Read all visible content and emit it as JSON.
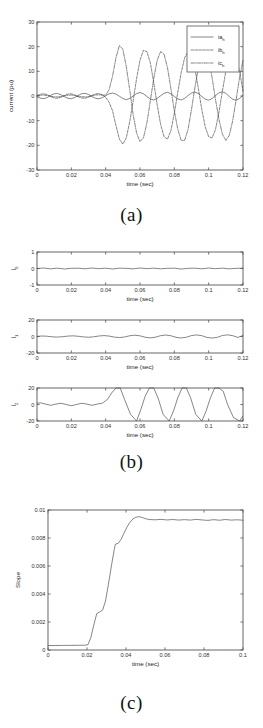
{
  "figure": {
    "panels": [
      {
        "id": "a",
        "caption": "(a)",
        "chart_index": 0
      },
      {
        "id": "b",
        "caption": "(b)",
        "chart_index": 1
      },
      {
        "id": "c",
        "caption": "(c)",
        "chart_index": 2
      }
    ]
  },
  "chart_data": [
    {
      "type": "line",
      "panel": "a",
      "title": "",
      "xlabel": "time (sec)",
      "ylabel": "current (pu)",
      "xlim": [
        0,
        0.12
      ],
      "ylim": [
        -30,
        30
      ],
      "xticks": [
        0,
        0.02,
        0.04,
        0.06,
        0.08,
        0.1,
        0.12
      ],
      "xticklabels": [
        "0",
        "0.02",
        "0.04",
        "0.06",
        "0.08",
        "0.1",
        "0.12"
      ],
      "yticks": [
        -30,
        -20,
        -10,
        0,
        10,
        20,
        30
      ],
      "yticklabels": [
        "-30",
        "-20",
        "-10",
        "0",
        "10",
        "20",
        "30"
      ],
      "grid": false,
      "legend": {
        "position": "upper-right",
        "entries": [
          {
            "label": "ia_h",
            "base": "ia",
            "sub": "h",
            "style": "solid"
          },
          {
            "label": "ib_h",
            "base": "ib",
            "sub": "h",
            "style": "dash"
          },
          {
            "label": "ic_h",
            "base": "ic",
            "sub": "h",
            "style": "dashdot"
          }
        ]
      },
      "series": [
        {
          "name": "ia_h",
          "style": "solid",
          "x": [
            0,
            0.002,
            0.004,
            0.006,
            0.008,
            0.01,
            0.012,
            0.014,
            0.016,
            0.018,
            0.02,
            0.022,
            0.024,
            0.026,
            0.028,
            0.03,
            0.032,
            0.034,
            0.036,
            0.038,
            0.04,
            0.042,
            0.044,
            0.046,
            0.048,
            0.05,
            0.052,
            0.054,
            0.056,
            0.058,
            0.06,
            0.062,
            0.064,
            0.066,
            0.068,
            0.07,
            0.072,
            0.074,
            0.076,
            0.078,
            0.08,
            0.082,
            0.084,
            0.086,
            0.088,
            0.09,
            0.092,
            0.094,
            0.096,
            0.098,
            0.1,
            0.102,
            0.104,
            0.106,
            0.108,
            0.11,
            0.112,
            0.114,
            0.116,
            0.118,
            0.12
          ],
          "y": [
            -0.3,
            -0.9,
            -1.1,
            -0.6,
            0.3,
            0.9,
            1.0,
            0.5,
            -0.3,
            -0.9,
            -1.1,
            -0.6,
            0.2,
            0.9,
            1.1,
            0.6,
            -0.2,
            -0.9,
            -1.1,
            -0.7,
            0.1,
            0.9,
            1.2,
            0.8,
            -0.1,
            -1.0,
            -1.5,
            -1.0,
            0.0,
            1.0,
            1.4,
            0.9,
            -0.2,
            -1.2,
            -1.6,
            -1.0,
            0.1,
            1.1,
            1.5,
            0.9,
            -0.2,
            -1.2,
            -1.6,
            -1.0,
            0.2,
            1.2,
            1.6,
            1.0,
            -0.2,
            -1.3,
            -1.7,
            -1.0,
            0.2,
            1.3,
            1.7,
            1.1,
            -0.2,
            -1.3,
            -1.7,
            -1.0,
            0.3
          ]
        },
        {
          "name": "ib_h",
          "style": "dash",
          "x": [
            0,
            0.002,
            0.004,
            0.006,
            0.008,
            0.01,
            0.012,
            0.014,
            0.016,
            0.018,
            0.02,
            0.022,
            0.024,
            0.026,
            0.028,
            0.03,
            0.032,
            0.034,
            0.036,
            0.038,
            0.04,
            0.042,
            0.044,
            0.046,
            0.048,
            0.05,
            0.052,
            0.054,
            0.056,
            0.058,
            0.06,
            0.062,
            0.064,
            0.066,
            0.068,
            0.07,
            0.072,
            0.074,
            0.076,
            0.078,
            0.08,
            0.082,
            0.084,
            0.086,
            0.088,
            0.09,
            0.092,
            0.094,
            0.096,
            0.098,
            0.1,
            0.102,
            0.104,
            0.106,
            0.108,
            0.11,
            0.112,
            0.114,
            0.116,
            0.118,
            0.12
          ],
          "y": [
            0.2,
            0.7,
            0.9,
            0.5,
            -0.3,
            -0.8,
            -0.9,
            -0.5,
            0.2,
            0.8,
            0.9,
            0.4,
            -0.3,
            -0.8,
            -0.9,
            -0.5,
            0.2,
            0.8,
            1.0,
            0.5,
            -0.5,
            -2.5,
            -6.0,
            -12.0,
            -17.5,
            -19.5,
            -17.0,
            -10.5,
            -2.0,
            7.0,
            14.5,
            18.5,
            18.0,
            13.5,
            5.5,
            -3.5,
            -11.5,
            -16.5,
            -17.5,
            -14.0,
            -7.0,
            1.5,
            9.5,
            15.5,
            18.0,
            16.5,
            11.0,
            3.0,
            -5.5,
            -12.5,
            -16.5,
            -17.0,
            -13.5,
            -6.5,
            2.0,
            10.0,
            15.5,
            17.5,
            15.5,
            10.0,
            2.0
          ]
        },
        {
          "name": "ic_h",
          "style": "dashdot",
          "x": [
            0,
            0.002,
            0.004,
            0.006,
            0.008,
            0.01,
            0.012,
            0.014,
            0.016,
            0.018,
            0.02,
            0.022,
            0.024,
            0.026,
            0.028,
            0.03,
            0.032,
            0.034,
            0.036,
            0.038,
            0.04,
            0.042,
            0.044,
            0.046,
            0.048,
            0.05,
            0.052,
            0.054,
            0.056,
            0.058,
            0.06,
            0.062,
            0.064,
            0.066,
            0.068,
            0.07,
            0.072,
            0.074,
            0.076,
            0.078,
            0.08,
            0.082,
            0.084,
            0.086,
            0.088,
            0.09,
            0.092,
            0.094,
            0.096,
            0.098,
            0.1,
            0.102,
            0.104,
            0.106,
            0.108,
            0.11,
            0.112,
            0.114,
            0.116,
            0.118,
            0.12
          ],
          "y": [
            0.1,
            0.3,
            0.4,
            0.2,
            -0.1,
            -0.3,
            -0.4,
            -0.2,
            0.1,
            0.3,
            0.4,
            0.2,
            -0.1,
            -0.3,
            -0.4,
            -0.2,
            0.1,
            0.4,
            0.5,
            0.3,
            0.4,
            2.5,
            8.0,
            15.5,
            20.5,
            19.0,
            12.0,
            2.5,
            -7.5,
            -15.0,
            -18.5,
            -17.0,
            -11.0,
            -2.0,
            7.0,
            14.5,
            18.0,
            17.0,
            11.5,
            3.0,
            -6.0,
            -13.5,
            -18.0,
            -18.0,
            -13.5,
            -5.5,
            3.5,
            11.5,
            17.0,
            18.0,
            14.5,
            7.5,
            -1.5,
            -9.5,
            -15.5,
            -18.0,
            -16.0,
            -10.0,
            -1.5,
            7.5,
            14.5
          ]
        }
      ]
    },
    {
      "type": "line",
      "panel": "b",
      "subplots": [
        {
          "ylabel_base": "i",
          "ylabel_sub": "0",
          "xlabel": "time (sec)",
          "xlim": [
            0,
            0.12
          ],
          "ylim": [
            -1,
            1
          ],
          "xticks": [
            0,
            0.02,
            0.04,
            0.06,
            0.08,
            0.1,
            0.12
          ],
          "xticklabels": [
            "0",
            "0.02",
            "0.04",
            "0.06",
            "0.08",
            "0.1",
            "0.12"
          ],
          "yticks": [
            -1,
            0,
            1
          ],
          "yticklabels": [
            "-1",
            "0",
            "1"
          ],
          "series": {
            "name": "i0",
            "style": "solid",
            "x": [
              0,
              0.004,
              0.008,
              0.012,
              0.016,
              0.02,
              0.024,
              0.028,
              0.032,
              0.036,
              0.04,
              0.044,
              0.048,
              0.052,
              0.056,
              0.06,
              0.064,
              0.068,
              0.072,
              0.076,
              0.08,
              0.084,
              0.088,
              0.092,
              0.096,
              0.1,
              0.104,
              0.108,
              0.112,
              0.116,
              0.12
            ],
            "y": [
              0.0,
              0.03,
              -0.02,
              0.02,
              -0.03,
              0.01,
              0.02,
              -0.02,
              0.03,
              -0.01,
              0.02,
              -0.03,
              0.02,
              0.01,
              -0.02,
              0.03,
              -0.01,
              0.02,
              -0.02,
              0.01,
              0.02,
              -0.03,
              0.01,
              0.02,
              -0.02,
              0.03,
              -0.01,
              0.02,
              -0.02,
              0.01,
              0.02
            ]
          }
        },
        {
          "ylabel_base": "i",
          "ylabel_sub": "1",
          "xlabel": "time (sec)",
          "xlim": [
            0,
            0.12
          ],
          "ylim": [
            -20,
            20
          ],
          "xticks": [
            0,
            0.02,
            0.04,
            0.06,
            0.08,
            0.1,
            0.12
          ],
          "xticklabels": [
            "0",
            "0.02",
            "0.04",
            "0.06",
            "0.08",
            "0.1",
            "0.12"
          ],
          "yticks": [
            -20,
            0,
            20
          ],
          "yticklabels": [
            "-20",
            "0",
            "20"
          ],
          "series": {
            "name": "i1",
            "style": "solid",
            "x": [
              0,
              0.003,
              0.006,
              0.009,
              0.012,
              0.015,
              0.018,
              0.021,
              0.024,
              0.027,
              0.03,
              0.033,
              0.036,
              0.039,
              0.042,
              0.045,
              0.048,
              0.051,
              0.054,
              0.057,
              0.06,
              0.063,
              0.066,
              0.069,
              0.072,
              0.075,
              0.078,
              0.081,
              0.084,
              0.087,
              0.09,
              0.093,
              0.096,
              0.099,
              0.102,
              0.105,
              0.108,
              0.111,
              0.114,
              0.117,
              0.12
            ],
            "y": [
              0.2,
              0.6,
              0.3,
              -0.4,
              -0.7,
              -0.2,
              0.5,
              0.8,
              0.3,
              -0.5,
              -0.9,
              -0.4,
              0.6,
              1.1,
              0.5,
              -0.7,
              -1.3,
              -0.6,
              0.9,
              1.6,
              0.8,
              -0.9,
              -1.7,
              -0.8,
              1.0,
              1.8,
              0.9,
              -1.0,
              -1.8,
              -0.9,
              1.1,
              1.9,
              1.0,
              -1.1,
              -1.9,
              -1.0,
              1.2,
              2.0,
              1.0,
              -1.1,
              1.2
            ]
          }
        },
        {
          "ylabel_base": "i",
          "ylabel_sub": "2",
          "xlabel": "time (sec)",
          "xlim": [
            0,
            0.12
          ],
          "ylim": [
            -20,
            20
          ],
          "xticks": [
            0,
            0.02,
            0.04,
            0.06,
            0.08,
            0.1,
            0.12
          ],
          "xticklabels": [
            "0",
            "0.02",
            "0.04",
            "0.06",
            "0.08",
            "0.1",
            "0.12"
          ],
          "yticks": [
            -20,
            0,
            20
          ],
          "yticklabels": [
            "-20",
            "0",
            "20"
          ],
          "series": {
            "name": "i2",
            "style": "solid",
            "x": [
              0,
              0.002,
              0.005,
              0.008,
              0.011,
              0.014,
              0.017,
              0.02,
              0.023,
              0.026,
              0.029,
              0.032,
              0.035,
              0.038,
              0.041,
              0.0435,
              0.046,
              0.0485,
              0.051,
              0.0545,
              0.058,
              0.0605,
              0.063,
              0.0655,
              0.068,
              0.0705,
              0.0735,
              0.077,
              0.0795,
              0.082,
              0.0845,
              0.087,
              0.0895,
              0.0925,
              0.096,
              0.0985,
              0.101,
              0.1035,
              0.106,
              0.1085,
              0.111,
              0.1145,
              0.118,
              0.12
            ],
            "y": [
              1.5,
              2.0,
              0.5,
              -1.0,
              0.5,
              1.5,
              0.0,
              -1.5,
              0.0,
              1.5,
              0.5,
              -1.0,
              0.5,
              1.5,
              6.0,
              14.0,
              20.0,
              20.0,
              6.0,
              -12.0,
              -20.0,
              -6.0,
              10.0,
              20.0,
              20.0,
              8.0,
              -12.0,
              -20.0,
              -8.0,
              8.0,
              20.0,
              20.0,
              8.0,
              -12.0,
              -20.0,
              -8.0,
              8.0,
              20.0,
              20.0,
              16.0,
              0.0,
              -16.0,
              -20.0,
              -14.0
            ]
          }
        }
      ]
    },
    {
      "type": "line",
      "panel": "c",
      "title": "",
      "xlabel": "time (sec)",
      "ylabel": "Slope",
      "xlim": [
        0,
        0.1
      ],
      "ylim": [
        0,
        0.01
      ],
      "xticks": [
        0,
        0.02,
        0.04,
        0.06,
        0.08,
        0.1
      ],
      "xticklabels": [
        "0",
        "0.02",
        "0.04",
        "0.06",
        "0.08",
        "0.1"
      ],
      "yticks": [
        0,
        0.002,
        0.004,
        0.006,
        0.008,
        0.01
      ],
      "yticklabels": [
        "0",
        "0.002",
        "0.004",
        "0.006",
        "0.008",
        "0.01"
      ],
      "grid": false,
      "series": [
        {
          "name": "Slope",
          "style": "solid",
          "x": [
            0,
            0.004,
            0.008,
            0.012,
            0.016,
            0.019,
            0.0205,
            0.022,
            0.0235,
            0.025,
            0.0265,
            0.028,
            0.0295,
            0.031,
            0.0325,
            0.034,
            0.0345,
            0.036,
            0.0375,
            0.039,
            0.0405,
            0.042,
            0.0435,
            0.045,
            0.0465,
            0.048,
            0.05,
            0.052,
            0.055,
            0.058,
            0.061,
            0.064,
            0.067,
            0.07,
            0.073,
            0.076,
            0.079,
            0.082,
            0.085,
            0.088,
            0.091,
            0.094,
            0.097,
            0.1
          ],
          "y": [
            0.00032,
            0.00032,
            0.00033,
            0.00033,
            0.00034,
            0.00034,
            0.00038,
            0.0009,
            0.0018,
            0.0026,
            0.00272,
            0.00285,
            0.0035,
            0.0047,
            0.006,
            0.0072,
            0.00755,
            0.00762,
            0.0079,
            0.00835,
            0.00878,
            0.00912,
            0.00935,
            0.00948,
            0.00952,
            0.00948,
            0.00938,
            0.00932,
            0.0093,
            0.00933,
            0.00929,
            0.00932,
            0.00928,
            0.00931,
            0.00928,
            0.00933,
            0.00929,
            0.00926,
            0.00931,
            0.00927,
            0.00932,
            0.00928,
            0.0093,
            0.00927
          ]
        }
      ]
    }
  ]
}
